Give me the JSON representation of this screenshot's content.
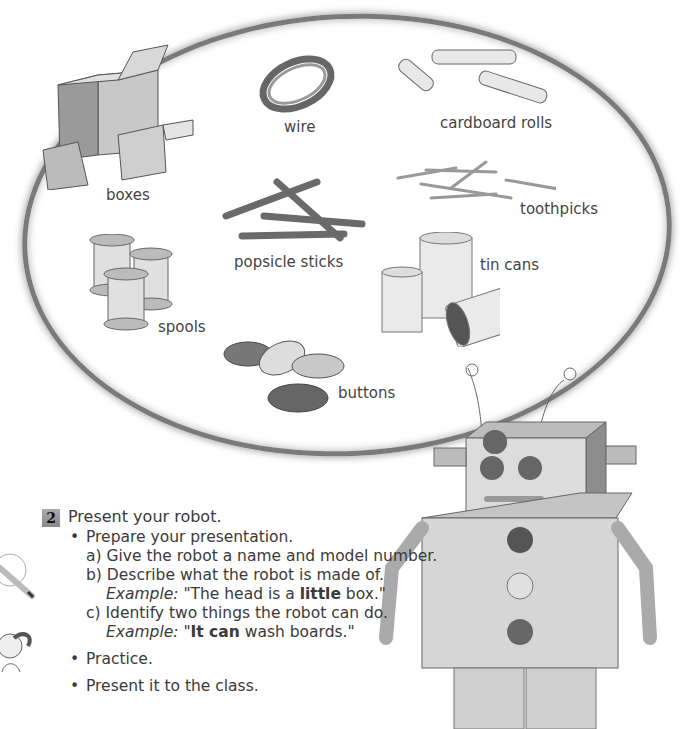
{
  "materials": [
    {
      "id": "boxes",
      "label": "boxes"
    },
    {
      "id": "wire",
      "label": "wire"
    },
    {
      "id": "cardboard-rolls",
      "label": "cardboard rolls"
    },
    {
      "id": "toothpicks",
      "label": "toothpicks"
    },
    {
      "id": "popsicle-sticks",
      "label": "popsicle sticks"
    },
    {
      "id": "spools",
      "label": "spools"
    },
    {
      "id": "tin-cans",
      "label": "tin cans"
    },
    {
      "id": "buttons",
      "label": "buttons"
    }
  ],
  "activity": {
    "number": "2",
    "title": "Present your robot.",
    "bullets": [
      {
        "text": "Prepare your presentation.",
        "subitems": [
          {
            "marker": "a)",
            "text": "Give the robot a name and model number."
          },
          {
            "marker": "b)",
            "text": "Describe what the robot is made of.",
            "example_label": "Example:",
            "example_pre": "\"The head is a ",
            "example_bold": "little",
            "example_post": " box.\""
          },
          {
            "marker": "c)",
            "text": "Identify two things the robot can do.",
            "example_label": "Example:",
            "example_pre": "\"",
            "example_bold": "It can",
            "example_post": " wash boards.\""
          }
        ]
      },
      {
        "text": "Practice."
      },
      {
        "text": "Present it to the class."
      }
    ]
  },
  "icons": [
    "pencil-icon",
    "girl-thinking-icon",
    "robot-illustration"
  ]
}
